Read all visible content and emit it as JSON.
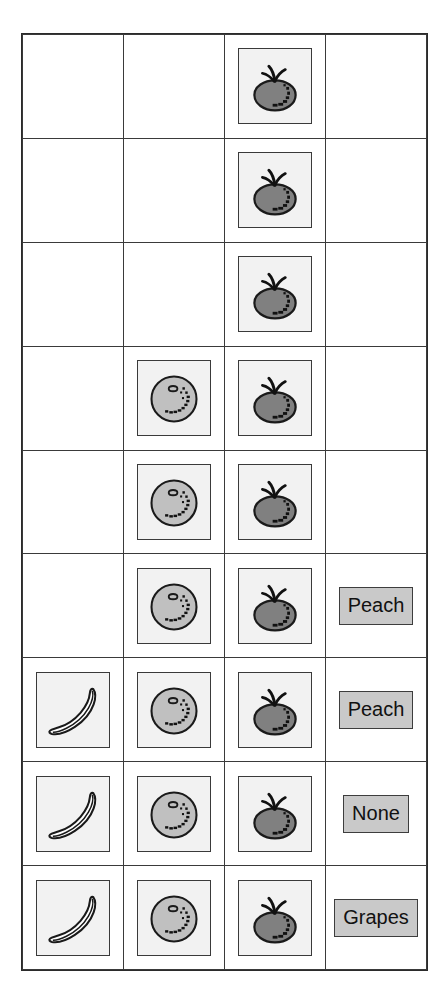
{
  "page": {
    "background_color": "#ffffff",
    "grid_line_color": "#3a3a3a"
  },
  "icons": {
    "banana": {
      "name": "banana-icon",
      "fill_color": "#ffffff",
      "outline_color": "#1a1a1a"
    },
    "peach": {
      "name": "peach-icon",
      "fill_color": "#c0c0c0",
      "outline_color": "#1a1a1a"
    },
    "tomato": {
      "name": "tomato-icon",
      "fill_color": "#808080",
      "outline_color": "#1a1a1a"
    }
  },
  "label_chip": {
    "background_color": "#c9c9c9",
    "border_color": "#3d3d3d",
    "text_color": "#111111"
  },
  "table": {
    "columns": 4,
    "rows": 9,
    "column_contents": [
      "banana",
      "peach",
      "tomato",
      "label"
    ],
    "cells": [
      [
        null,
        null,
        "tomato",
        null
      ],
      [
        null,
        null,
        "tomato",
        null
      ],
      [
        null,
        null,
        "tomato",
        null
      ],
      [
        null,
        "peach",
        "tomato",
        null
      ],
      [
        null,
        "peach",
        "tomato",
        null
      ],
      [
        null,
        "peach",
        "tomato",
        "Peach"
      ],
      [
        "banana",
        "peach",
        "tomato",
        "Peach"
      ],
      [
        "banana",
        "peach",
        "tomato",
        "None"
      ],
      [
        "banana",
        "peach",
        "tomato",
        "Grapes"
      ]
    ],
    "labels": {
      "row6": "Peach",
      "row7": "Peach",
      "row8": "None",
      "row9": "Grapes"
    }
  }
}
